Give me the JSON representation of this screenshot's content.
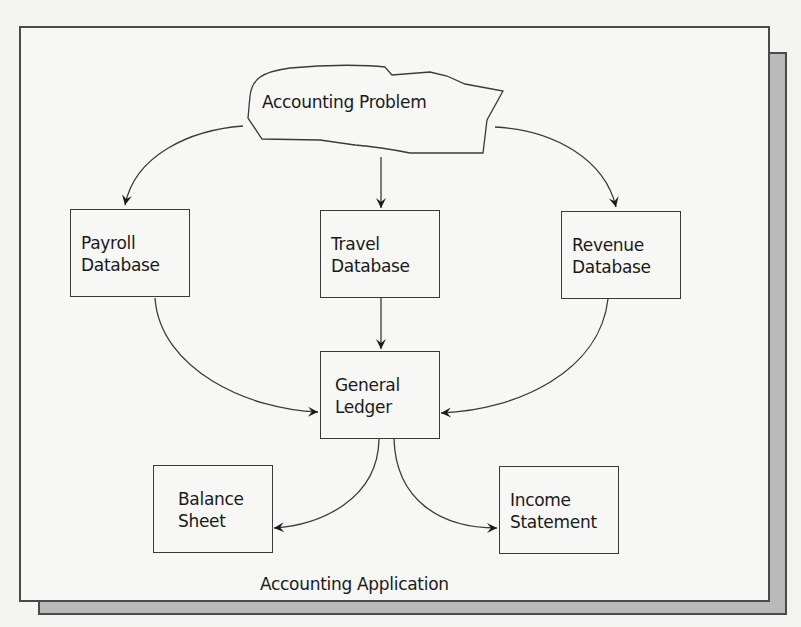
{
  "diagram": {
    "title": "Accounting Application",
    "source": {
      "label": "Accounting Problem",
      "shape": "cloud"
    },
    "databases": [
      {
        "id": "payroll",
        "label": "Payroll\nDatabase"
      },
      {
        "id": "travel",
        "label": "Travel\nDatabase"
      },
      {
        "id": "revenue",
        "label": "Revenue\nDatabase"
      }
    ],
    "ledger": {
      "id": "general-ledger",
      "label": "General\nLedger"
    },
    "outputs": [
      {
        "id": "balance-sheet",
        "label": "Balance\nSheet"
      },
      {
        "id": "income-statement",
        "label": "Income\nStatement"
      }
    ],
    "edges": [
      {
        "from": "Accounting Problem",
        "to": "Payroll Database"
      },
      {
        "from": "Accounting Problem",
        "to": "Travel Database"
      },
      {
        "from": "Accounting Problem",
        "to": "Revenue Database"
      },
      {
        "from": "Payroll Database",
        "to": "General Ledger"
      },
      {
        "from": "Travel Database",
        "to": "General Ledger"
      },
      {
        "from": "Revenue Database",
        "to": "General Ledger"
      },
      {
        "from": "General Ledger",
        "to": "Balance Sheet"
      },
      {
        "from": "General Ledger",
        "to": "Income Statement"
      }
    ],
    "colors": {
      "line": "#3a3a3a",
      "frame": "#4a4a4a",
      "shadow": "#b9b9b9",
      "background": "#f7f7f5"
    }
  }
}
